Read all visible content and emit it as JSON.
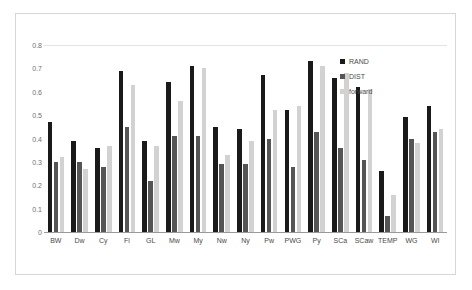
{
  "chart_data": {
    "type": "bar",
    "title": "",
    "subtitle": "",
    "xlabel": "",
    "ylabel": "",
    "ylim": [
      0,
      0.8
    ],
    "yticks": [
      "0",
      "0.1",
      "0.2",
      "0.3",
      "0.4",
      "0.5",
      "0.6",
      "0.7",
      "0.8"
    ],
    "ytick_values": [
      0,
      0.1,
      0.2,
      0.3,
      0.4,
      0.5,
      0.6,
      0.7,
      0.8
    ],
    "grid": "horizontal-top-only",
    "legend_position": "top-right-inside",
    "categories": [
      "BW",
      "Dw",
      "Cy",
      "Fl",
      "GL",
      "Mw",
      "My",
      "Nw",
      "Ny",
      "Pw",
      "PWG",
      "Py",
      "SCa",
      "SCaw",
      "TEMP",
      "WG",
      "Wl"
    ],
    "series": [
      {
        "name": "RAND",
        "color": "#1a1a1a",
        "values": [
          0.47,
          0.39,
          0.36,
          0.69,
          0.39,
          0.64,
          0.71,
          0.45,
          0.44,
          0.67,
          0.52,
          0.73,
          0.66,
          0.62,
          0.26,
          0.49,
          0.54
        ]
      },
      {
        "name": "DIST",
        "color": "#555555",
        "values": [
          0.3,
          0.3,
          0.28,
          0.45,
          0.22,
          0.41,
          0.41,
          0.29,
          0.29,
          0.4,
          0.28,
          0.43,
          0.36,
          0.31,
          0.07,
          0.4,
          0.43
        ]
      },
      {
        "name": "forward",
        "color": "#d2d2d2",
        "values": [
          0.32,
          0.27,
          0.37,
          0.63,
          0.37,
          0.56,
          0.7,
          0.33,
          0.39,
          0.52,
          0.54,
          0.71,
          0.68,
          0.61,
          0.16,
          0.38,
          0.44
        ]
      }
    ]
  }
}
